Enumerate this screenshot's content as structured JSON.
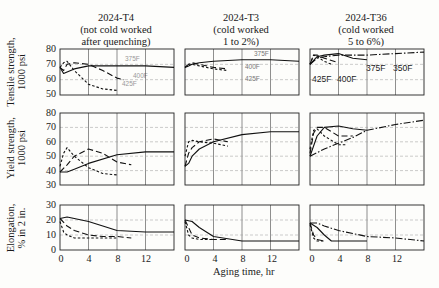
{
  "figure": {
    "columns": [
      {
        "title_line1": "2024-T4",
        "title_line2": "(not cold worked",
        "title_line3": "after quenching)"
      },
      {
        "title_line1": "2024-T3",
        "title_line2": "(cold worked",
        "title_line3": "1 to 2%)"
      },
      {
        "title_line1": "2024-T36",
        "title_line2": "(cold worked",
        "title_line3": "5 to 6%)"
      }
    ],
    "rows": [
      {
        "ylabel_line1": "Tensile strength,",
        "ylabel_line2": "1000 psi",
        "ticks": [
          "80",
          "70",
          "60",
          "50"
        ]
      },
      {
        "ylabel_line1": "Yield strength,",
        "ylabel_line2": "1000 psi",
        "ticks": [
          "80",
          "70",
          "60",
          "50",
          "40",
          "30"
        ]
      },
      {
        "ylabel_line1": "Elongation,",
        "ylabel_line2": "% in 2 in.",
        "ticks": [
          "30",
          "20",
          "10",
          "0"
        ]
      }
    ],
    "xticks": [
      "0",
      "4",
      "8",
      "12"
    ],
    "xlabel": "Aging time, hr",
    "annotations": {
      "t4": [
        "375F",
        "400F",
        "425F"
      ],
      "t3": [
        "375F",
        "400F",
        "425F"
      ],
      "t36": [
        "425F",
        "400F",
        "375F",
        "350F"
      ]
    }
  },
  "chart_data": [
    {
      "type": "line",
      "title": "2024-T4 (not cold worked after quenching) — Tensile strength",
      "xlabel": "Aging time, hr",
      "ylabel": "Tensile strength, 1000 psi",
      "xlim": [
        0,
        16
      ],
      "ylim": [
        50,
        80
      ],
      "grid": true,
      "series": [
        {
          "name": "375F",
          "x": [
            0,
            0.5,
            1,
            2,
            4,
            8,
            12,
            16
          ],
          "values": [
            68,
            64,
            65,
            67,
            69,
            69,
            69,
            68
          ]
        },
        {
          "name": "400F",
          "x": [
            0,
            0.5,
            1,
            2,
            4,
            6,
            8,
            9
          ],
          "values": [
            68,
            66,
            70,
            71,
            70,
            66,
            61,
            60
          ]
        },
        {
          "name": "425F",
          "x": [
            0,
            0.5,
            1,
            2,
            4,
            6,
            8
          ],
          "values": [
            68,
            71,
            72,
            66,
            57,
            54,
            53
          ]
        }
      ]
    },
    {
      "type": "line",
      "title": "2024-T3 (cold worked 1 to 2%) — Tensile strength",
      "xlabel": "Aging time, hr",
      "ylabel": "Tensile strength, 1000 psi",
      "xlim": [
        0,
        16
      ],
      "ylim": [
        50,
        80
      ],
      "grid": true,
      "series": [
        {
          "name": "375F",
          "x": [
            0,
            0.5,
            1,
            2,
            4,
            8,
            12,
            16
          ],
          "values": [
            68,
            69,
            70,
            71,
            72,
            73,
            73,
            72
          ]
        },
        {
          "name": "400F",
          "x": [
            0,
            0.5,
            1,
            2,
            4,
            6
          ],
          "values": [
            68,
            70,
            71,
            70,
            68,
            67
          ]
        },
        {
          "name": "425F",
          "x": [
            0,
            0.5,
            1,
            2,
            4,
            6
          ],
          "values": [
            68,
            70,
            70,
            69,
            67,
            66
          ]
        }
      ]
    },
    {
      "type": "line",
      "title": "2024-T36 (cold worked 5 to 6%) — Tensile strength",
      "xlabel": "Aging time, hr",
      "ylabel": "Tensile strength, 1000 psi",
      "xlim": [
        0,
        16
      ],
      "ylim": [
        50,
        80
      ],
      "grid": true,
      "series": [
        {
          "name": "350F",
          "x": [
            0,
            1,
            2,
            4,
            8,
            12,
            16
          ],
          "values": [
            70,
            74,
            75,
            76,
            76,
            77,
            78
          ]
        },
        {
          "name": "375F",
          "x": [
            0,
            1,
            2,
            4,
            6,
            8
          ],
          "values": [
            70,
            75,
            76,
            77,
            74,
            73
          ]
        },
        {
          "name": "400F",
          "x": [
            0,
            0.5,
            1,
            2,
            4
          ],
          "values": [
            70,
            76,
            76,
            74,
            71
          ]
        },
        {
          "name": "425F",
          "x": [
            0,
            0.5,
            1,
            2,
            3
          ],
          "values": [
            70,
            76,
            75,
            72,
            70
          ]
        }
      ]
    },
    {
      "type": "line",
      "title": "2024-T4 — Yield strength",
      "xlabel": "Aging time, hr",
      "ylabel": "Yield strength, 1000 psi",
      "xlim": [
        0,
        16
      ],
      "ylim": [
        30,
        80
      ],
      "grid": true,
      "series": [
        {
          "name": "375F",
          "x": [
            0,
            1,
            2,
            4,
            8,
            12,
            16
          ],
          "values": [
            39,
            39,
            41,
            45,
            51,
            53,
            53
          ]
        },
        {
          "name": "400F",
          "x": [
            0,
            1,
            2,
            4,
            6,
            8,
            10
          ],
          "values": [
            39,
            44,
            50,
            55,
            52,
            46,
            44
          ]
        },
        {
          "name": "425F",
          "x": [
            0,
            0.5,
            1,
            2,
            4,
            6,
            8
          ],
          "values": [
            43,
            52,
            56,
            50,
            42,
            38,
            37
          ]
        }
      ]
    },
    {
      "type": "line",
      "title": "2024-T3 — Yield strength",
      "xlabel": "Aging time, hr",
      "ylabel": "Yield strength, 1000 psi",
      "xlim": [
        0,
        16
      ],
      "ylim": [
        30,
        80
      ],
      "grid": true,
      "series": [
        {
          "name": "375F",
          "x": [
            0,
            0.5,
            1,
            2,
            4,
            8,
            12,
            16
          ],
          "values": [
            43,
            45,
            50,
            55,
            60,
            65,
            67,
            67
          ]
        },
        {
          "name": "400F",
          "x": [
            0,
            0.5,
            1,
            2,
            4,
            6
          ],
          "values": [
            43,
            52,
            56,
            60,
            62,
            60
          ]
        },
        {
          "name": "425F",
          "x": [
            0,
            0.5,
            1,
            2,
            4,
            6
          ],
          "values": [
            50,
            60,
            61,
            60,
            59,
            57
          ]
        }
      ]
    },
    {
      "type": "line",
      "title": "2024-T36 — Yield strength",
      "xlabel": "Aging time, hr",
      "ylabel": "Yield strength, 1000 psi",
      "xlim": [
        0,
        16
      ],
      "ylim": [
        30,
        80
      ],
      "grid": true,
      "series": [
        {
          "name": "350F",
          "x": [
            0,
            2,
            4,
            6,
            8,
            12,
            16
          ],
          "values": [
            50,
            55,
            59,
            63,
            68,
            72,
            75
          ]
        },
        {
          "name": "375F",
          "x": [
            0,
            1,
            2,
            4,
            6,
            8
          ],
          "values": [
            50,
            64,
            70,
            71,
            69,
            68
          ]
        },
        {
          "name": "400F",
          "x": [
            0,
            0.5,
            1,
            2,
            4,
            6
          ],
          "values": [
            52,
            66,
            70,
            70,
            64,
            64
          ]
        },
        {
          "name": "425F",
          "x": [
            0,
            0.5,
            1,
            2,
            4,
            5
          ],
          "values": [
            55,
            68,
            69,
            64,
            58,
            58
          ]
        }
      ]
    },
    {
      "type": "line",
      "title": "2024-T4 — Elongation",
      "xlabel": "Aging time, hr",
      "ylabel": "Elongation, % in 2 in.",
      "xlim": [
        0,
        16
      ],
      "ylim": [
        0,
        30
      ],
      "grid": true,
      "series": [
        {
          "name": "375F",
          "x": [
            0,
            1,
            2,
            4,
            6,
            8,
            12,
            16
          ],
          "values": [
            21,
            22,
            21,
            19,
            16,
            13,
            12,
            12
          ]
        },
        {
          "name": "400F",
          "x": [
            0,
            1,
            2,
            4,
            6,
            8,
            10
          ],
          "values": [
            21,
            16,
            13,
            10,
            9,
            9,
            8
          ]
        },
        {
          "name": "425F",
          "x": [
            0,
            0.5,
            1,
            2,
            4,
            6,
            8
          ],
          "values": [
            19,
            12,
            10,
            8,
            8,
            8,
            8
          ]
        }
      ]
    },
    {
      "type": "line",
      "title": "2024-T3 — Elongation",
      "xlabel": "Aging time, hr",
      "ylabel": "Elongation, % in 2 in.",
      "xlim": [
        0,
        16
      ],
      "ylim": [
        0,
        30
      ],
      "grid": true,
      "series": [
        {
          "name": "375F",
          "x": [
            0,
            1,
            2,
            4,
            8,
            12,
            16
          ],
          "values": [
            20,
            19,
            15,
            9,
            6,
            6,
            6
          ]
        },
        {
          "name": "400F",
          "x": [
            0,
            0.5,
            1,
            2,
            4,
            6
          ],
          "values": [
            20,
            15,
            10,
            8,
            7,
            7
          ]
        },
        {
          "name": "425F",
          "x": [
            0,
            0.5,
            1,
            2,
            4
          ],
          "values": [
            19,
            10,
            8,
            7,
            7
          ]
        }
      ]
    },
    {
      "type": "line",
      "title": "2024-T36 — Elongation",
      "xlabel": "Aging time, hr",
      "ylabel": "Elongation, % in 2 in.",
      "xlim": [
        0,
        16
      ],
      "ylim": [
        0,
        30
      ],
      "grid": true,
      "series": [
        {
          "name": "350F",
          "x": [
            0,
            1,
            2,
            4,
            8,
            12,
            16
          ],
          "values": [
            18,
            18,
            16,
            13,
            9,
            8,
            6
          ]
        },
        {
          "name": "375F",
          "x": [
            0,
            1,
            2,
            3,
            8
          ],
          "values": [
            18,
            15,
            10,
            6,
            6
          ]
        },
        {
          "name": "400F",
          "x": [
            0,
            0.5,
            1,
            2
          ],
          "values": [
            18,
            10,
            7,
            6
          ]
        },
        {
          "name": "425F",
          "x": [
            0,
            0.5,
            1,
            2
          ],
          "values": [
            17,
            8,
            6,
            6
          ]
        }
      ]
    }
  ]
}
